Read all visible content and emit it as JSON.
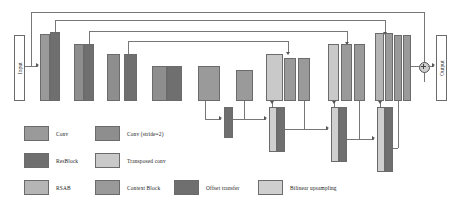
{
  "diagram": {
    "input_label": "Input",
    "output_label": "Output",
    "sum_node": "element-wise addition"
  },
  "colors": {
    "conv": "#9a9a9a",
    "conv_stride2": "#8e8e8e",
    "resblock": "#6f6f6f",
    "transposed_conv": "#c9c9c9",
    "rsab": "#b5b5b5",
    "context_block": "#9a9a9a",
    "offset_transfer": "#6f6f6f",
    "bilinear_upsampling": "#cfcfcf",
    "line": "#777777",
    "border": "#6b6b6b",
    "background": "#ffffff"
  },
  "legend": {
    "rows": [
      [
        {
          "label": "Conv",
          "swatch": "conv"
        },
        {
          "label": "Conv (stride=2)",
          "swatch": "conv_stride2"
        }
      ],
      [
        {
          "label": "ResBlock",
          "swatch": "resblock"
        },
        {
          "label": "Transposed conv",
          "swatch": "transposed_conv"
        }
      ],
      [
        {
          "label": "RSAB",
          "swatch": "rsab"
        },
        {
          "label": "Context Block",
          "swatch": "context_block"
        },
        {
          "label": "Offset transfer",
          "swatch": "offset_transfer"
        },
        {
          "label": "Bilinear upsampling",
          "swatch": "bilinear_upsampling"
        }
      ]
    ]
  },
  "blocks": {
    "encoder": [
      {
        "name": "enc1-conv",
        "type": "conv"
      },
      {
        "name": "enc1-res",
        "type": "resblock"
      },
      {
        "name": "enc2-conv",
        "type": "conv_stride2"
      },
      {
        "name": "enc2-res",
        "type": "resblock"
      },
      {
        "name": "enc3-conv",
        "type": "conv_stride2"
      },
      {
        "name": "enc3-res",
        "type": "resblock"
      },
      {
        "name": "enc4-conv",
        "type": "conv_stride2"
      },
      {
        "name": "enc4-res",
        "type": "resblock"
      }
    ],
    "bottleneck": [
      {
        "name": "context-block-1",
        "type": "context_block"
      },
      {
        "name": "context-block-2",
        "type": "context_block"
      }
    ],
    "decoder": [
      {
        "name": "dec1-tconv",
        "type": "transposed_conv"
      },
      {
        "name": "dec1-res",
        "type": "resblock"
      },
      {
        "name": "dec1-conv",
        "type": "conv"
      },
      {
        "name": "dec2-tconv",
        "type": "transposed_conv"
      },
      {
        "name": "dec2-res",
        "type": "resblock"
      },
      {
        "name": "dec2-conv",
        "type": "conv"
      },
      {
        "name": "dec3-rsab",
        "type": "rsab"
      },
      {
        "name": "dec3-res",
        "type": "resblock"
      },
      {
        "name": "dec3-conv",
        "type": "conv"
      },
      {
        "name": "dec3-conv2",
        "type": "conv"
      }
    ],
    "offset_path": [
      {
        "name": "offset-transfer-1",
        "type": "offset_transfer"
      },
      {
        "name": "bilinear-up-1",
        "type": "bilinear_upsampling"
      },
      {
        "name": "offset-transfer-2",
        "type": "offset_transfer"
      },
      {
        "name": "bilinear-up-2",
        "type": "bilinear_upsampling"
      },
      {
        "name": "offset-transfer-3",
        "type": "offset_transfer"
      },
      {
        "name": "bilinear-up-3",
        "type": "bilinear_upsampling"
      },
      {
        "name": "offset-transfer-4",
        "type": "offset_transfer"
      }
    ]
  }
}
